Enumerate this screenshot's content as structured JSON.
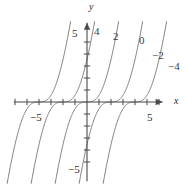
{
  "figure": {
    "kind": "cartesian-graph",
    "background": "#ffffff",
    "stroke_color": "#6b6b6b",
    "axis_color": "#4a4a4a",
    "width": 185,
    "height": 185
  },
  "axes": {
    "x_label": "x",
    "y_label": "y",
    "x_tick_labels": [
      {
        "text": "−5",
        "value": -5,
        "x": 30,
        "y": 112
      },
      {
        "text": "5",
        "value": 5,
        "x": 147,
        "y": 112
      }
    ],
    "y_tick_labels": [
      {
        "text": "5",
        "value": 5,
        "x": 72,
        "y": 28
      },
      {
        "text": "−5",
        "value": -5,
        "x": 68,
        "y": 164
      }
    ],
    "x_axis_label_pos": {
      "x": 174,
      "y": 96
    },
    "y_axis_label_pos": {
      "x": 89,
      "y": 2
    },
    "origin_px": {
      "x": 87,
      "y": 102
    },
    "unit_px": 12,
    "x_tick_values": [
      -6,
      -5,
      -4,
      -3,
      -2,
      -1,
      1,
      2,
      3,
      4,
      5,
      6
    ],
    "y_tick_values": [
      -5,
      -4,
      -3,
      -2,
      -1,
      1,
      2,
      3,
      4,
      5
    ],
    "xlim": [
      -7.2,
      8.2
    ],
    "ylim": [
      -8.5,
      8.5
    ],
    "grid": false
  },
  "chart_data": {
    "type": "line",
    "title": "",
    "xlabel": "x",
    "ylabel": "y",
    "xlim": [
      -7.2,
      8.2
    ],
    "ylim": [
      -8.5,
      8.5
    ],
    "grid": false,
    "legend": "curve-end-labels",
    "categories": [],
    "series": [
      {
        "name": "4",
        "label": "4",
        "label_pos": {
          "x": 94,
          "y": 26
        },
        "shift": -4,
        "values": []
      },
      {
        "name": "2",
        "label": "2",
        "label_pos": {
          "x": 113,
          "y": 31
        },
        "shift": -2,
        "values": []
      },
      {
        "name": "0",
        "label": "0",
        "label_pos": {
          "x": 139,
          "y": 35
        },
        "shift": 0,
        "values": []
      },
      {
        "name": "-2",
        "label": "−2",
        "label_pos": {
          "x": 152,
          "y": 50
        },
        "shift": 2,
        "values": []
      },
      {
        "name": "-4",
        "label": "−4",
        "label_pos": {
          "x": 168,
          "y": 61
        },
        "shift": 4,
        "values": []
      }
    ]
  }
}
